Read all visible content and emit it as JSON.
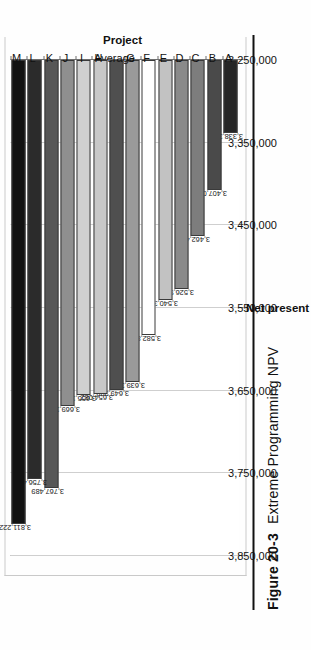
{
  "figure": {
    "number": "Figure 20-3",
    "title": "Extreme Programming NPV"
  },
  "chart_data": {
    "type": "bar",
    "orientation": "horizontal",
    "title": "",
    "xlabel": "Project",
    "ylabel": "Net present value ($)",
    "ylim": [
      3250000,
      3850000
    ],
    "ytick_labels": [
      "3,250,000",
      "3,350,000",
      "3,450,000",
      "3,550,000",
      "3,650,000",
      "3,750,000",
      "3,850,000"
    ],
    "ytick_values": [
      3250000,
      3350000,
      3450000,
      3550000,
      3650000,
      3750000,
      3850000
    ],
    "grid": true,
    "legend": "none",
    "categories": [
      "A",
      "B",
      "C",
      "D",
      "E",
      "F",
      "G",
      "Average",
      "H",
      "I",
      "J",
      "K",
      "L",
      "M"
    ],
    "values": [
      3338345,
      3407038,
      3462496,
      3526946,
      3540328,
      3582863,
      3639362,
      3649388,
      3654082,
      3655110,
      3669147,
      3767489,
      3756441,
      3811222
    ],
    "data_labels": [
      "3,338,345",
      "3,407,038",
      "3,462,496",
      "3,526,946",
      "3,540,328",
      "3,582,863",
      "3,639,362",
      "3,649,388",
      "3,654,082",
      "3,655,110",
      "3,669,147",
      "3,767,489",
      "3,756,441",
      "3,811,222"
    ],
    "bar_colors": [
      "#262626",
      "#4a4a4a",
      "#7d7d7d",
      "#8a8a8a",
      "#c2c2c2",
      "#ffffff",
      "#9a9a9a",
      "#4f4f4f",
      "#c8c8c8",
      "#d0d0d0",
      "#8f8f8f",
      "#575757",
      "#2b2b2b",
      "#121212"
    ]
  }
}
